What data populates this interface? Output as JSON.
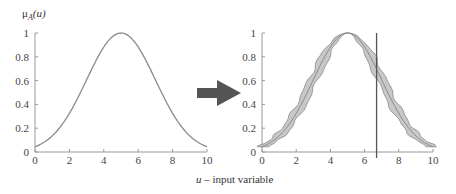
{
  "chart_data": [
    {
      "type": "line",
      "title": "",
      "ylabel": "μA(u)",
      "xlabel": "",
      "xlim": [
        0,
        10
      ],
      "ylim": [
        0,
        1
      ],
      "xticks": [
        "0",
        "2",
        "4",
        "6",
        "8",
        "10"
      ],
      "yticks": [
        "0",
        "0.2",
        "0.4",
        "0.6",
        "0.8",
        "1"
      ],
      "grid": false,
      "series": [
        {
          "name": "Gaussian membership function",
          "center": 5,
          "sigma": 2,
          "x": [
            0,
            1,
            2,
            3,
            4,
            5,
            6,
            7,
            8,
            9,
            10
          ],
          "values": [
            0.04,
            0.14,
            0.32,
            0.61,
            0.88,
            1.0,
            0.88,
            0.61,
            0.32,
            0.14,
            0.04
          ]
        }
      ]
    },
    {
      "type": "area",
      "title": "",
      "ylabel": "",
      "xlabel": "u – input variable",
      "xlim": [
        0,
        10
      ],
      "ylim": [
        0,
        1
      ],
      "xticks": [
        "0",
        "2",
        "4",
        "6",
        "8",
        "10"
      ],
      "yticks": [
        "0",
        "0.2",
        "0.4",
        "0.6",
        "0.8",
        "1"
      ],
      "grid": false,
      "series": [
        {
          "name": "Upper membership bound",
          "x": [
            0,
            1,
            2,
            3,
            4,
            5,
            6,
            7,
            8,
            9,
            10
          ],
          "values": [
            0.06,
            0.2,
            0.42,
            0.74,
            0.95,
            1.0,
            0.95,
            0.74,
            0.42,
            0.2,
            0.06
          ]
        },
        {
          "name": "Lower membership bound",
          "x": [
            0,
            1,
            2,
            3,
            4,
            5,
            6,
            7,
            8,
            9,
            10
          ],
          "values": [
            0.04,
            0.1,
            0.22,
            0.48,
            0.8,
            1.0,
            0.8,
            0.48,
            0.22,
            0.1,
            0.04
          ]
        },
        {
          "name": "Mean membership",
          "x": [
            0,
            1,
            2,
            3,
            4,
            5,
            6,
            7,
            8,
            9,
            10
          ],
          "values": [
            0.04,
            0.14,
            0.32,
            0.61,
            0.88,
            1.0,
            0.88,
            0.61,
            0.32,
            0.14,
            0.04
          ]
        }
      ],
      "annotations": [
        {
          "type": "vertical-line",
          "x": 6.7
        }
      ]
    }
  ],
  "labels": {
    "y_axis_left": "μ",
    "y_axis_sub": "A",
    "y_axis_arg": "(u)",
    "x_axis_var": "u",
    "x_axis_rest": " – input variable"
  },
  "colors": {
    "curve": "#8a8a8a",
    "band": "#c8c8c8",
    "arrow": "#555555",
    "axis": "#999999",
    "vline": "#555555"
  }
}
